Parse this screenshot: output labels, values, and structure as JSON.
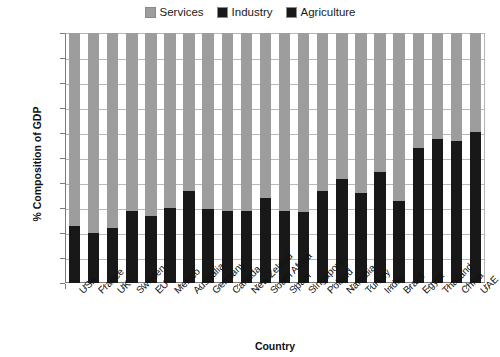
{
  "chart_data": {
    "type": "bar",
    "subtype": "stacked-100-percent",
    "title": "",
    "xlabel": "Country",
    "ylabel": "% Composition of GDP",
    "ylim": [
      0,
      100
    ],
    "ytick_labels": [
      "100%",
      "90%",
      "80%",
      "70%",
      "60%",
      "50%",
      "40%",
      "30%",
      "20%",
      "10%",
      "0%"
    ],
    "ytick_values": [
      100,
      90,
      80,
      70,
      60,
      50,
      40,
      30,
      20,
      10,
      0
    ],
    "grid": true,
    "legend_position": "top-center",
    "categories": [
      "USA",
      "France",
      "UK",
      "Sweden",
      "EU",
      "Mexico",
      "Australia",
      "Germany",
      "Canada",
      "New Zeland",
      "South Africa",
      "Spain",
      "Singapore",
      "Poland",
      "Namibia",
      "Turkey",
      "India",
      "Brazil",
      "Egypt",
      "Thailand",
      "China",
      "UAE"
    ],
    "series": [
      {
        "name": "Services",
        "color": "#9d9d9d",
        "values": [
          77,
          80,
          78,
          71,
          73,
          70,
          63,
          70.5,
          71,
          71,
          66,
          71,
          71.5,
          63,
          58.5,
          64,
          55.5,
          67,
          46,
          42.5,
          43,
          39.5
        ]
      },
      {
        "name": "Industry",
        "color": "#181818",
        "values": [
          22,
          19.5,
          21.5,
          28,
          26.5,
          29,
          36,
          28.5,
          28.5,
          28,
          33.5,
          28.5,
          28.5,
          36.5,
          41,
          35,
          43.5,
          32.5,
          53,
          56.5,
          56,
          59.5
        ]
      },
      {
        "name": "Agriculture",
        "color": "#181818",
        "values": [
          1,
          0.5,
          0.5,
          1,
          0.5,
          1,
          1,
          1,
          0.5,
          1,
          0.5,
          0.5,
          0,
          0.5,
          0.5,
          1,
          1,
          0.5,
          1,
          1,
          1,
          1
        ]
      }
    ]
  },
  "legend": {
    "items": [
      {
        "label": "Services",
        "color": "#9d9d9d"
      },
      {
        "label": "Industry",
        "color": "#181818"
      },
      {
        "label": "Agriculture",
        "color": "#181818"
      }
    ]
  },
  "axes": {
    "y_title": "% Composition of GDP",
    "x_title": "Country"
  }
}
